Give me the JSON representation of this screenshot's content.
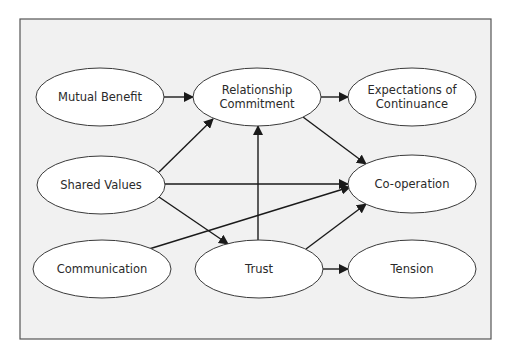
{
  "diagram": {
    "type": "flow-diagram",
    "frame": {
      "x": 20,
      "y": 19,
      "width": 471,
      "height": 320,
      "fill": "#f1f1f1",
      "stroke": "#555555"
    },
    "nodes": [
      {
        "id": "mutual_benefit",
        "lines": [
          "Mutual Benefit"
        ],
        "cx": 100,
        "cy": 97,
        "rx": 64,
        "ry": 29
      },
      {
        "id": "relationship_commitment",
        "lines": [
          "Relationship",
          "Commitment"
        ],
        "cx": 257,
        "cy": 97,
        "rx": 64,
        "ry": 29
      },
      {
        "id": "expectations_of_continuance",
        "lines": [
          "Expectations of",
          "Continuance"
        ],
        "cx": 412,
        "cy": 97,
        "rx": 64,
        "ry": 29
      },
      {
        "id": "shared_values",
        "lines": [
          "Shared Values"
        ],
        "cx": 101,
        "cy": 185,
        "rx": 64,
        "ry": 29
      },
      {
        "id": "co_operation",
        "lines": [
          "Co-operation"
        ],
        "cx": 412,
        "cy": 184,
        "rx": 64,
        "ry": 29
      },
      {
        "id": "communication",
        "lines": [
          "Communication"
        ],
        "cx": 102,
        "cy": 269,
        "rx": 69,
        "ry": 29
      },
      {
        "id": "trust",
        "lines": [
          "Trust"
        ],
        "cx": 259,
        "cy": 269,
        "rx": 64,
        "ry": 29
      },
      {
        "id": "tension",
        "lines": [
          "Tension"
        ],
        "cx": 412,
        "cy": 269,
        "rx": 64,
        "ry": 29
      }
    ],
    "edges": [
      {
        "from": "mutual_benefit",
        "to": "relationship_commitment",
        "x1": 164,
        "y1": 97,
        "x2": 193,
        "y2": 97
      },
      {
        "from": "relationship_commitment",
        "to": "expectations_of_continuance",
        "x1": 321,
        "y1": 97,
        "x2": 348,
        "y2": 97
      },
      {
        "from": "shared_values",
        "to": "relationship_commitment",
        "x1": 159,
        "y1": 172,
        "x2": 213,
        "y2": 119
      },
      {
        "from": "relationship_commitment",
        "to": "co_operation",
        "x1": 303,
        "y1": 117,
        "x2": 366,
        "y2": 164
      },
      {
        "from": "shared_values",
        "to": "co_operation",
        "x1": 165,
        "y1": 184,
        "x2": 348,
        "y2": 184
      },
      {
        "from": "shared_values",
        "to": "trust",
        "x1": 159,
        "y1": 197,
        "x2": 228,
        "y2": 244
      },
      {
        "from": "communication",
        "to": "co_operation",
        "x1": 149,
        "y1": 249,
        "x2": 350,
        "y2": 187
      },
      {
        "from": "trust",
        "to": "relationship_commitment",
        "x1": 258,
        "y1": 240,
        "x2": 258,
        "y2": 126
      },
      {
        "from": "trust",
        "to": "co_operation",
        "x1": 306,
        "y1": 249,
        "x2": 366,
        "y2": 204
      },
      {
        "from": "trust",
        "to": "tension",
        "x1": 323,
        "y1": 269,
        "x2": 348,
        "y2": 269
      }
    ],
    "colors": {
      "line": "#1a1a1a",
      "node_fill": "#ffffff",
      "node_stroke": "#3a3a3a",
      "text": "#2a2a2a"
    }
  }
}
